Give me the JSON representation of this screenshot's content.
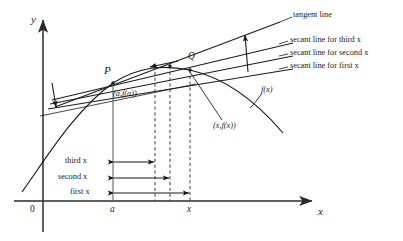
{
  "figure": {
    "type": "calculus-secant-tangent-diagram",
    "axes": {
      "origin_label": "0",
      "y_axis_label": "y",
      "x_axis_label": "x",
      "x_tick_labels": [
        "a",
        "x"
      ]
    },
    "points": {
      "p_label": "P",
      "p_coordinates": "(a,f(a))",
      "q_label": "Q",
      "q_coordinates": "(x,f(x))"
    },
    "curve_label": "f(x)",
    "annotations": [
      {
        "id": "tangent",
        "label": "tangent line"
      },
      {
        "id": "secant-third",
        "label": "secant line for third x"
      },
      {
        "id": "secant-second",
        "label": "secant line for second x"
      },
      {
        "id": "secant-first",
        "label": "secant line for first x"
      }
    ],
    "measurements": [
      {
        "id": "third",
        "label": "third x"
      },
      {
        "id": "second",
        "label": "second x"
      },
      {
        "id": "first",
        "label": "first x"
      }
    ],
    "colors": {
      "ink": "#1a1a1a",
      "axis": "#2b2b2b",
      "background": "#ffffff"
    }
  }
}
